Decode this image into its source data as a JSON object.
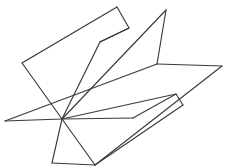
{
  "figure": {
    "background_color": "#ffffff",
    "stroke_color": "#3a3a3a",
    "stroke_width": 1.15,
    "canvas": {
      "width": 226,
      "height": 168
    },
    "shapes": [
      {
        "name": "upper-left-plane",
        "closed": false,
        "points": "117,7 22,63 62,119"
      },
      {
        "name": "upper-left-plane-inner-edge",
        "closed": false,
        "points": "117,7 129,28 100,42"
      },
      {
        "name": "upper-right-plane",
        "closed": false,
        "points": "129,28 100,42 62,119"
      },
      {
        "name": "tall-plane-left-edge",
        "closed": false,
        "points": "166,10 62,119"
      },
      {
        "name": "tall-plane-right-edge",
        "closed": false,
        "points": "166,10 157,64"
      },
      {
        "name": "mid-horizontal-band-top",
        "closed": false,
        "points": "157,64 222,66"
      },
      {
        "name": "mid-horizontal-band-left",
        "closed": false,
        "points": "157,64 5,121"
      },
      {
        "name": "baseline-horizontal",
        "closed": false,
        "points": "5,121 62,119 133,118"
      },
      {
        "name": "lower-right-plane-upper-edge",
        "closed": false,
        "points": "133,118 176,94 183,105"
      },
      {
        "name": "lower-right-plane-notch-edge",
        "closed": false,
        "points": "183,105 95,165"
      },
      {
        "name": "lower-right-plane-long-edge",
        "closed": false,
        "points": "222,66 95,165"
      },
      {
        "name": "lower-left-triangle-left",
        "closed": false,
        "points": "62,119 52,163"
      },
      {
        "name": "lower-left-triangle-base",
        "closed": false,
        "points": "52,163 95,165"
      },
      {
        "name": "lower-center-spur",
        "closed": false,
        "points": "62,119 95,165"
      },
      {
        "name": "converge-to-upper-right-diagonal",
        "closed": false,
        "points": "62,119 176,94"
      }
    ]
  }
}
